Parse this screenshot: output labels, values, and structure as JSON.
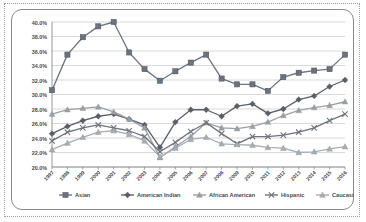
{
  "chart_data": {
    "type": "line",
    "title": "",
    "subtitle": "",
    "xlabel": "",
    "ylabel": "",
    "grid": true,
    "legend_position": "bottom",
    "ylim": [
      20.0,
      40.0
    ],
    "ytick_step": 2.0,
    "ytick_labels": [
      "20.0%",
      "22.0%",
      "24.0%",
      "26.0%",
      "28.0%",
      "30.0%",
      "32.0%",
      "34.0%",
      "36.0%",
      "38.0%",
      "40.0%"
    ],
    "ytick_values": [
      20.0,
      22.0,
      24.0,
      26.0,
      28.0,
      30.0,
      32.0,
      34.0,
      36.0,
      38.0,
      40.0
    ],
    "categories": [
      "1997",
      "1998",
      "1999",
      "2000",
      "2001",
      "2002",
      "2003",
      "2004",
      "2005",
      "2006",
      "2007",
      "2008",
      "2009",
      "2010",
      "2011",
      "2012",
      "2013",
      "2014",
      "2015",
      "2016"
    ],
    "x": [
      1997,
      1998,
      1999,
      2000,
      2001,
      2002,
      2003,
      2004,
      2005,
      2006,
      2007,
      2008,
      2009,
      2010,
      2011,
      2012,
      2013,
      2014,
      2015,
      2016
    ],
    "series": [
      {
        "name": "Asian",
        "color": "#6b7380",
        "marker": "square",
        "values": [
          30.6,
          35.5,
          37.9,
          39.4,
          40.0,
          35.8,
          33.5,
          31.9,
          33.2,
          34.4,
          35.5,
          32.2,
          31.4,
          31.4,
          30.5,
          32.4,
          33.0,
          33.3,
          33.5,
          35.5
        ]
      },
      {
        "name": "American Indian",
        "color": "#5a6068",
        "marker": "diamond",
        "values": [
          24.6,
          25.6,
          26.4,
          27.0,
          27.3,
          26.6,
          25.8,
          22.7,
          26.2,
          27.9,
          27.9,
          27.0,
          28.4,
          28.7,
          27.4,
          28.0,
          29.3,
          29.8,
          31.1,
          32.0
        ]
      },
      {
        "name": "African American",
        "color": "#9aa0a6",
        "marker": "triangle",
        "values": [
          27.3,
          27.9,
          28.1,
          28.3,
          27.6,
          26.6,
          25.4,
          21.3,
          22.8,
          24.2,
          26.1,
          25.4,
          25.3,
          25.6,
          26.2,
          27.1,
          27.8,
          28.2,
          28.5,
          29.0
        ]
      },
      {
        "name": "Hispanic",
        "color": "#6e747c",
        "marker": "x",
        "values": [
          23.6,
          24.8,
          25.4,
          25.8,
          25.4,
          25.0,
          24.2,
          22.1,
          23.4,
          24.9,
          26.1,
          24.6,
          23.2,
          24.2,
          24.2,
          24.4,
          24.8,
          25.4,
          26.4,
          27.3
        ]
      },
      {
        "name": "Caucasian",
        "color": "#a8aeb4",
        "marker": "triangle",
        "values": [
          22.4,
          23.3,
          24.1,
          24.8,
          25.0,
          24.5,
          23.6,
          21.4,
          22.6,
          23.8,
          24.1,
          23.2,
          23.1,
          23.0,
          22.7,
          22.6,
          22.0,
          22.1,
          22.5,
          22.8
        ]
      }
    ]
  },
  "legend": {
    "items": [
      {
        "label": "Asian"
      },
      {
        "label": "American Indian"
      },
      {
        "label": "African American"
      },
      {
        "label": "Hispanic"
      },
      {
        "label": "Caucasian"
      }
    ]
  }
}
